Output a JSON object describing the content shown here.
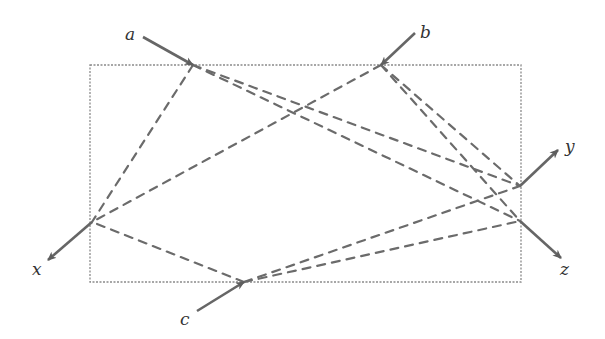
{
  "diagram": {
    "type": "bipartite-path-diagram",
    "colors": {
      "box": "#8a8a8a",
      "dashed_lines": "#6b6b6b",
      "arrows": "#666666",
      "labels": "#333333"
    },
    "box": {
      "x1": 90,
      "y1": 65,
      "x2": 521,
      "y2": 282
    },
    "inputs": [
      {
        "id": "a",
        "label": "a",
        "point": [
          193,
          65
        ],
        "from": [
          143,
          37
        ],
        "label_pos": [
          125,
          40
        ]
      },
      {
        "id": "b",
        "label": "b",
        "point": [
          381,
          65
        ],
        "from": [
          415,
          33
        ],
        "label_pos": [
          420,
          38
        ]
      },
      {
        "id": "c",
        "label": "c",
        "point": [
          244,
          282
        ],
        "from": [
          197,
          311
        ],
        "label_pos": [
          180,
          325
        ]
      }
    ],
    "outputs": [
      {
        "id": "x",
        "label": "x",
        "point": [
          92,
          222
        ],
        "to": [
          48,
          260
        ],
        "label_pos": [
          32,
          275
        ]
      },
      {
        "id": "y",
        "label": "y",
        "point": [
          520,
          186
        ],
        "to": [
          558,
          150
        ],
        "label_pos": [
          565,
          152
        ]
      },
      {
        "id": "z",
        "label": "z",
        "point": [
          520,
          221
        ],
        "to": [
          561,
          258
        ],
        "label_pos": [
          560,
          275
        ]
      }
    ],
    "connections": [
      [
        "a",
        "x"
      ],
      [
        "a",
        "y"
      ],
      [
        "a",
        "z"
      ],
      [
        "b",
        "x"
      ],
      [
        "b",
        "y"
      ],
      [
        "b",
        "z"
      ],
      [
        "c",
        "x"
      ],
      [
        "c",
        "y"
      ],
      [
        "c",
        "z"
      ]
    ]
  }
}
